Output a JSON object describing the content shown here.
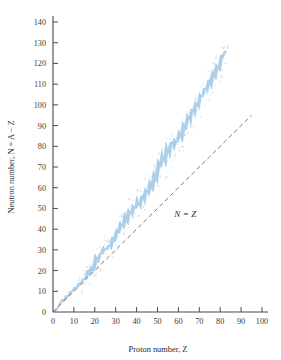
{
  "chart_data": {
    "type": "area",
    "title": "",
    "subtitle": "",
    "xlabel": "Proton number, Z",
    "ylabel": "Neutron number, N = A − Z",
    "xlim": [
      0,
      100
    ],
    "ylim": [
      0,
      140
    ],
    "xticks": [
      0,
      10,
      20,
      30,
      40,
      50,
      60,
      70,
      80,
      90,
      100
    ],
    "yticks": [
      0,
      10,
      20,
      30,
      40,
      50,
      60,
      70,
      80,
      90,
      100,
      110,
      120,
      130,
      140
    ],
    "xtick_labels": [
      "0",
      "10",
      "20",
      "30",
      "40",
      "50",
      "60",
      "70",
      "80",
      "90",
      "100"
    ],
    "ytick_labels": [
      "0",
      "10",
      "20",
      "30",
      "40",
      "50",
      "60",
      "70",
      "80",
      "90",
      "100",
      "110",
      "120",
      "130",
      "140"
    ],
    "grid": false,
    "legend": "none",
    "band_color": "#a9cde9",
    "band_edge_color": "#8fbcdf",
    "axis_color": "#4a4a4a",
    "reference_line_color": "#6e6e6e",
    "annotations": [
      {
        "text": "N = Z",
        "x": 58,
        "y": 46,
        "style": "italic"
      }
    ],
    "series": [
      {
        "name": "Stable nuclides band (valley of stability)",
        "type": "band",
        "x": [
          1,
          2,
          3,
          4,
          5,
          6,
          7,
          8,
          9,
          10,
          11,
          12,
          13,
          14,
          15,
          16,
          17,
          18,
          19,
          20,
          21,
          22,
          23,
          24,
          25,
          26,
          27,
          28,
          29,
          30,
          31,
          32,
          33,
          34,
          35,
          36,
          37,
          38,
          39,
          40,
          41,
          42,
          43,
          44,
          45,
          46,
          47,
          48,
          49,
          50,
          51,
          52,
          53,
          54,
          55,
          56,
          57,
          58,
          59,
          60,
          61,
          62,
          63,
          64,
          65,
          66,
          67,
          68,
          69,
          70,
          71,
          72,
          73,
          74,
          75,
          76,
          77,
          78,
          79,
          80,
          81,
          82,
          83
        ],
        "n_low": [
          0,
          1,
          3,
          5,
          5,
          6,
          7,
          8,
          10,
          10,
          12,
          12,
          14,
          14,
          16,
          16,
          18,
          18,
          20,
          20,
          24,
          24,
          28,
          28,
          30,
          30,
          32,
          30,
          34,
          34,
          38,
          38,
          42,
          40,
          44,
          42,
          48,
          46,
          50,
          50,
          52,
          50,
          55,
          52,
          58,
          56,
          60,
          58,
          64,
          62,
          70,
          70,
          74,
          70,
          78,
          74,
          82,
          78,
          82,
          82,
          85,
          82,
          88,
          88,
          94,
          90,
          98,
          94,
          100,
          98,
          104,
          104,
          108,
          106,
          110,
          108,
          114,
          112,
          118,
          116,
          122,
          124,
          126
        ],
        "n_high": [
          1,
          2,
          4,
          6,
          6,
          8,
          8,
          10,
          10,
          12,
          12,
          14,
          14,
          16,
          16,
          20,
          20,
          22,
          22,
          28,
          26,
          28,
          29,
          32,
          30,
          32,
          32,
          36,
          36,
          40,
          40,
          44,
          42,
          48,
          46,
          50,
          48,
          52,
          50,
          56,
          52,
          56,
          56,
          60,
          58,
          64,
          62,
          68,
          66,
          74,
          72,
          78,
          74,
          82,
          78,
          82,
          82,
          84,
          82,
          88,
          86,
          92,
          90,
          96,
          94,
          98,
          98,
          102,
          100,
          106,
          104,
          108,
          108,
          112,
          112,
          116,
          116,
          120,
          118,
          124,
          124,
          126,
          126
        ]
      },
      {
        "name": "N = Z reference line",
        "type": "line",
        "style": "dashed",
        "x": [
          0,
          95
        ],
        "y": [
          0,
          95
        ]
      }
    ]
  }
}
